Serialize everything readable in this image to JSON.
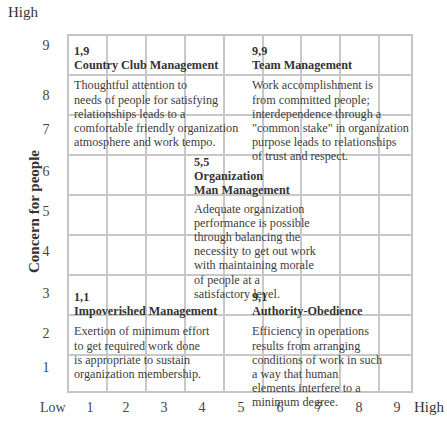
{
  "y_axis": {
    "label": "Concern for people",
    "high_label": "High",
    "ticks": [
      "9",
      "8",
      "7",
      "6",
      "5",
      "4",
      "3",
      "2",
      "1"
    ]
  },
  "x_axis": {
    "low_label": "Low",
    "high_label": "High",
    "ticks": [
      "1",
      "2",
      "3",
      "4",
      "5",
      "6",
      "7",
      "8",
      "9"
    ]
  },
  "grid": {
    "rows": 9,
    "cols": 9,
    "line_color": "#c8c8c8"
  },
  "styles": [
    {
      "code": "1,9",
      "title": "Country Club Management",
      "description": "Thoughtful attention to\nneeds of people for satisfying\nrelationships leads to a\ncomfortable friendly organization\natmosphere and work tempo."
    },
    {
      "code": "9,9",
      "title": "Team Management",
      "description": "Work accomplishment is\nfrom committed people;\ninterdependence through a\n\"common stake\" in organization\npurpose leads to relationships\nof trust and respect."
    },
    {
      "code": "5,5",
      "title": "Organization\nMan Management",
      "description": "Adequate organization\nperformance is possible\nthrough balancing the\nnecessity to get out work\nwith maintaining morale\nof people at a\nsatisfactory level."
    },
    {
      "code": "1,1",
      "title": "Impoverished Management",
      "description": "Exertion of minimum effort\nto get required work done\nis appropriate to sustain\norganization membership."
    },
    {
      "code": "9,1",
      "title": "Authority-Obedience",
      "description": "Efficiency in operations\nresults from arranging\nconditions of work in such\na way that human\nelements interfere to a\nminimum degree."
    }
  ]
}
